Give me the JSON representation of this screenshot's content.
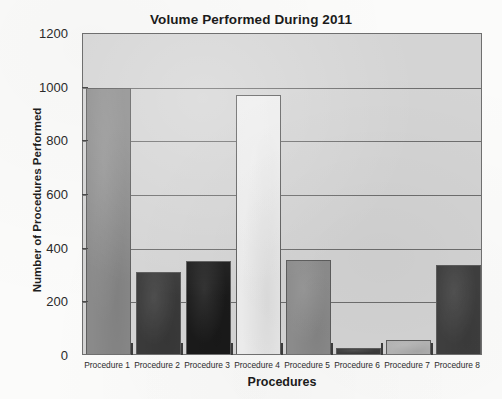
{
  "chart_data": {
    "type": "bar",
    "title": "Volume Performed During 2011",
    "xlabel": "Procedures",
    "ylabel": "Number of Procedures Performed",
    "categories": [
      "Procedure 1",
      "Procedure 2",
      "Procedure 3",
      "Procedure 4",
      "Procedure 5",
      "Procedure 6",
      "Procedure 7",
      "Procedure 8"
    ],
    "values": [
      990,
      307,
      345,
      965,
      350,
      22,
      52,
      333
    ],
    "bar_colors": [
      "#8a8a8a",
      "#3a3a3a",
      "#1a1a1a",
      "#ededed",
      "#8d8d8d",
      "#3d3d3d",
      "#b4b4b4",
      "#3f3f3f"
    ],
    "ylim": [
      0,
      1200
    ],
    "ytick_values": [
      0,
      200,
      400,
      600,
      800,
      1000,
      1200
    ],
    "ytick_labels": [
      "0",
      "200",
      "400",
      "600",
      "800",
      "1000",
      "1200"
    ],
    "grid": true,
    "grid_orientation": "horizontal",
    "legend": false,
    "plot_background": "#d4d4d4",
    "page_background": "#fbfbfa",
    "axis_color": "#6f6f6f"
  }
}
